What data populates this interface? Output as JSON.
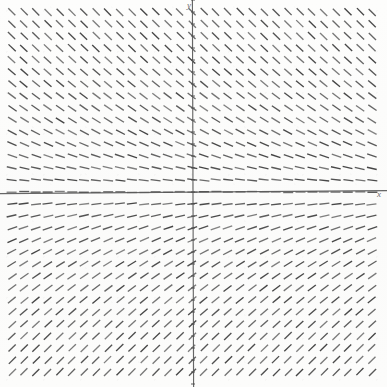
{
  "figure": {
    "kind": "slope-field",
    "title": "",
    "background_color": "#fcfcfb",
    "tick_color": "#4a4a4a",
    "axis_color": "#5a5a5a",
    "segment_color": "#3a3a3a"
  },
  "axes": {
    "x_label": "x",
    "y_label": "y",
    "x_axis_pixel_y": 192,
    "y_axis_pixel_x": 193,
    "tick_spacing_px": 12,
    "tick_length_px": 4,
    "show_grid": false
  },
  "chart_data": {
    "type": "scatter",
    "title": "",
    "xlabel": "x",
    "ylabel": "y",
    "equation": "dy/dx = -y",
    "xlim": [
      -7.5,
      7.5
    ],
    "ylim": [
      -7.5,
      7.5
    ],
    "grid": false,
    "legend": "none",
    "grid_spacing_units": 0.5,
    "segment_length_px": 10,
    "slope_samples": [
      {
        "y": 7.5,
        "slope": -1.0
      },
      {
        "y": 6.0,
        "slope": -0.95
      },
      {
        "y": 4.5,
        "slope": -0.82
      },
      {
        "y": 3.0,
        "slope": -0.62
      },
      {
        "y": 1.5,
        "slope": -0.34
      },
      {
        "y": 0.5,
        "slope": -0.12
      },
      {
        "y": 0.0,
        "slope": 0.0
      },
      {
        "y": -0.5,
        "slope": 0.12
      },
      {
        "y": -1.5,
        "slope": 0.34
      },
      {
        "y": -3.0,
        "slope": 0.62
      },
      {
        "y": -4.5,
        "slope": 0.82
      },
      {
        "y": -6.0,
        "slope": 0.95
      },
      {
        "y": -7.5,
        "slope": 1.0
      }
    ],
    "field_extent_px": {
      "left": 12,
      "right": 372,
      "top": 12,
      "bottom": 372
    }
  }
}
